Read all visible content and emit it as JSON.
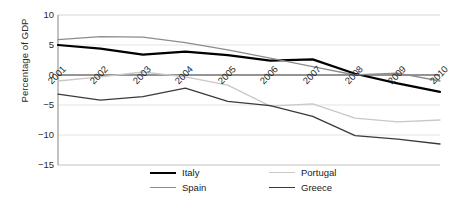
{
  "chart_data": {
    "type": "line",
    "title": "",
    "xlabel": "",
    "ylabel": "Percentage of GDP",
    "categories": [
      "2001",
      "2002",
      "2003",
      "2004",
      "2005",
      "2006",
      "2007",
      "2008",
      "2009",
      "2010"
    ],
    "x": [
      2001,
      2002,
      2003,
      2004,
      2005,
      2006,
      2007,
      2008,
      2009,
      2010
    ],
    "ylim": [
      -15,
      10
    ],
    "yticks": [
      "10",
      "5",
      "0",
      "-5",
      "-10",
      "-15"
    ],
    "ytick_values": [
      10,
      5,
      0,
      -5,
      -10,
      -15
    ],
    "grid": true,
    "legend_position": "bottom",
    "series": [
      {
        "name": "Italy",
        "color": "#000000",
        "width": 2.2,
        "values": [
          5.0,
          4.4,
          3.4,
          3.9,
          3.3,
          2.4,
          2.6,
          0.2,
          -1.4,
          -2.8
        ]
      },
      {
        "name": "Portugal",
        "color": "#c8c8c8",
        "width": 1.3,
        "values": [
          -1.0,
          -0.3,
          0.5,
          -0.3,
          -1.7,
          -5.2,
          -4.8,
          -7.2,
          -7.8,
          -7.5
        ]
      },
      {
        "name": "Spain",
        "color": "#8c8c8c",
        "width": 1.3,
        "values": [
          5.9,
          6.4,
          6.3,
          5.4,
          4.2,
          2.8,
          1.4,
          0.0,
          0.3,
          -1.0
        ]
      },
      {
        "name": "Greece",
        "color": "#3a3a3a",
        "width": 1.3,
        "values": [
          -3.2,
          -4.2,
          -3.6,
          -2.2,
          -4.4,
          -5.1,
          -6.9,
          -10.1,
          -10.7,
          -11.5
        ]
      }
    ]
  },
  "legend": {
    "items": [
      {
        "label": "Italy"
      },
      {
        "label": "Portugal"
      },
      {
        "label": "Spain"
      },
      {
        "label": "Greece"
      }
    ]
  },
  "axis": {
    "ylabel": "Percentage of GDP"
  }
}
